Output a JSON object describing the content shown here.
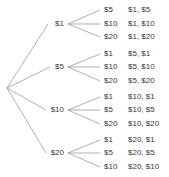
{
  "diagram": {
    "type": "probability-tree",
    "root": {
      "label": "",
      "x": 7,
      "y": 88
    },
    "colors": {
      "edge": "#8c8c8c",
      "text": "#3a3a3a",
      "background": "#ffffff"
    },
    "columns": {
      "level1_x": 64,
      "fan_x": 68,
      "level2_x": 104,
      "outcome_x": 128
    },
    "level1": [
      {
        "label": "$1",
        "x": 64,
        "y": 24
      },
      {
        "label": "$5",
        "x": 64,
        "y": 67
      },
      {
        "label": "$10",
        "x": 64,
        "y": 110
      },
      {
        "label": "$20",
        "x": 64,
        "y": 153
      }
    ],
    "level2": [
      {
        "label": "$5",
        "x": 104,
        "y": 10
      },
      {
        "label": "$10",
        "x": 104,
        "y": 24
      },
      {
        "label": "$20",
        "x": 104,
        "y": 37
      },
      {
        "label": "$1",
        "x": 104,
        "y": 54
      },
      {
        "label": "$10",
        "x": 104,
        "y": 67
      },
      {
        "label": "$20",
        "x": 104,
        "y": 81
      },
      {
        "label": "$1",
        "x": 104,
        "y": 97
      },
      {
        "label": "$5",
        "x": 104,
        "y": 110
      },
      {
        "label": "$20",
        "x": 104,
        "y": 124
      },
      {
        "label": "$1",
        "x": 104,
        "y": 140
      },
      {
        "label": "$5",
        "x": 104,
        "y": 153
      },
      {
        "label": "$10",
        "x": 104,
        "y": 167
      }
    ],
    "outcomes": [
      {
        "label": "$1, $5",
        "x": 128,
        "y": 10
      },
      {
        "label": "$1, $10",
        "x": 128,
        "y": 24
      },
      {
        "label": "$1, $20",
        "x": 128,
        "y": 37
      },
      {
        "label": "$5, $1",
        "x": 128,
        "y": 54
      },
      {
        "label": "$5, $10",
        "x": 128,
        "y": 67
      },
      {
        "label": "$5, $20",
        "x": 128,
        "y": 81
      },
      {
        "label": "$10, $1",
        "x": 128,
        "y": 97
      },
      {
        "label": "$10, $5",
        "x": 128,
        "y": 110
      },
      {
        "label": "$10, $20",
        "x": 128,
        "y": 124
      },
      {
        "label": "$20, $1",
        "x": 128,
        "y": 140
      },
      {
        "label": "$20, $5",
        "x": 128,
        "y": 153
      },
      {
        "label": "$20, $10",
        "x": 128,
        "y": 167
      }
    ],
    "edges_stage1": [
      {
        "x1": 7,
        "y1": 88,
        "x2": 48,
        "y2": 24
      },
      {
        "x1": 7,
        "y1": 88,
        "x2": 50,
        "y2": 67
      },
      {
        "x1": 7,
        "y1": 88,
        "x2": 46,
        "y2": 110
      },
      {
        "x1": 7,
        "y1": 88,
        "x2": 46,
        "y2": 153
      }
    ],
    "edges_stage2": [
      {
        "x1": 68,
        "y1": 24,
        "x2": 100,
        "y2": 10
      },
      {
        "x1": 68,
        "y1": 24,
        "x2": 100,
        "y2": 24
      },
      {
        "x1": 68,
        "y1": 24,
        "x2": 100,
        "y2": 37
      },
      {
        "x1": 68,
        "y1": 67,
        "x2": 100,
        "y2": 54
      },
      {
        "x1": 68,
        "y1": 67,
        "x2": 100,
        "y2": 67
      },
      {
        "x1": 68,
        "y1": 67,
        "x2": 100,
        "y2": 81
      },
      {
        "x1": 68,
        "y1": 110,
        "x2": 100,
        "y2": 97
      },
      {
        "x1": 68,
        "y1": 110,
        "x2": 100,
        "y2": 110
      },
      {
        "x1": 68,
        "y1": 110,
        "x2": 100,
        "y2": 124
      },
      {
        "x1": 68,
        "y1": 153,
        "x2": 100,
        "y2": 140
      },
      {
        "x1": 68,
        "y1": 153,
        "x2": 100,
        "y2": 153
      },
      {
        "x1": 68,
        "y1": 153,
        "x2": 100,
        "y2": 167
      }
    ]
  }
}
